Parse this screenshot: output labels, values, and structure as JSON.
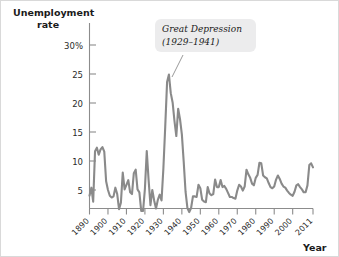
{
  "chart_data": {
    "type": "line",
    "title": "Unemployment rate",
    "ylabel": "Unemployment rate",
    "xlabel": "Year",
    "ylim": [
      0,
      32
    ],
    "xlim": [
      1890,
      2011
    ],
    "grid": false,
    "legend": false,
    "y_unit": "%",
    "y_ticks": [
      "30%",
      "25",
      "20",
      "15",
      "10",
      "5"
    ],
    "y_tick_values": [
      30,
      25,
      20,
      15,
      10,
      5
    ],
    "x_ticks": [
      "1890",
      "1900",
      "1910",
      "1920",
      "1930",
      "1940",
      "1950",
      "1960",
      "1970",
      "1980",
      "1990",
      "2000",
      "2011"
    ],
    "x_tick_values": [
      1890,
      1900,
      1910,
      1920,
      1930,
      1940,
      1950,
      1960,
      1970,
      1980,
      1990,
      2000,
      2011
    ],
    "line_color": "#8a8a8a",
    "annotations": [
      {
        "text_line1": "Great Depression",
        "text_line2": "(1929–1941)",
        "points_to_year": 1933,
        "points_to_value": 24.9
      }
    ],
    "series": [
      {
        "name": "Unemployment rate",
        "x": [
          1890,
          1891,
          1892,
          1893,
          1894,
          1895,
          1896,
          1897,
          1898,
          1899,
          1900,
          1901,
          1902,
          1903,
          1904,
          1905,
          1906,
          1907,
          1908,
          1909,
          1910,
          1911,
          1912,
          1913,
          1914,
          1915,
          1916,
          1917,
          1918,
          1919,
          1920,
          1921,
          1922,
          1923,
          1924,
          1925,
          1926,
          1927,
          1928,
          1929,
          1930,
          1931,
          1932,
          1933,
          1934,
          1935,
          1936,
          1937,
          1938,
          1939,
          1940,
          1941,
          1942,
          1943,
          1944,
          1945,
          1946,
          1947,
          1948,
          1949,
          1950,
          1951,
          1952,
          1953,
          1954,
          1955,
          1956,
          1957,
          1958,
          1959,
          1960,
          1961,
          1962,
          1963,
          1964,
          1965,
          1966,
          1967,
          1968,
          1969,
          1970,
          1971,
          1972,
          1973,
          1974,
          1975,
          1976,
          1977,
          1978,
          1979,
          1980,
          1981,
          1982,
          1983,
          1984,
          1985,
          1986,
          1987,
          1988,
          1989,
          1990,
          1991,
          1992,
          1993,
          1994,
          1995,
          1996,
          1997,
          1998,
          1999,
          2000,
          2001,
          2002,
          2003,
          2004,
          2005,
          2006,
          2007,
          2008,
          2009,
          2010,
          2011
        ],
        "values": [
          4.0,
          5.4,
          3.0,
          11.7,
          12.3,
          11.1,
          12.0,
          12.4,
          11.6,
          6.5,
          5.0,
          4.0,
          3.7,
          3.9,
          5.4,
          4.3,
          1.7,
          2.8,
          8.0,
          5.1,
          5.9,
          6.7,
          4.6,
          4.3,
          7.9,
          8.5,
          5.1,
          4.6,
          1.4,
          1.4,
          5.2,
          11.7,
          6.7,
          2.4,
          5.0,
          3.2,
          1.8,
          3.3,
          4.2,
          3.2,
          8.7,
          15.9,
          23.6,
          24.9,
          21.7,
          20.1,
          16.9,
          14.3,
          19.0,
          17.2,
          14.6,
          9.9,
          4.7,
          1.9,
          1.2,
          1.9,
          3.9,
          3.9,
          3.8,
          5.9,
          5.3,
          3.3,
          3.0,
          2.9,
          5.5,
          4.4,
          4.1,
          4.3,
          6.8,
          5.5,
          5.5,
          6.7,
          5.5,
          5.7,
          5.2,
          4.5,
          3.8,
          3.8,
          3.6,
          3.5,
          4.9,
          5.9,
          5.6,
          4.9,
          5.6,
          8.5,
          7.7,
          7.1,
          6.1,
          5.8,
          7.1,
          7.6,
          9.7,
          9.6,
          7.5,
          7.2,
          7.0,
          6.2,
          5.5,
          5.3,
          5.6,
          6.8,
          7.5,
          6.9,
          6.1,
          5.6,
          5.4,
          4.9,
          4.5,
          4.2,
          4.0,
          4.7,
          5.8,
          6.0,
          5.5,
          5.1,
          4.6,
          4.6,
          5.8,
          9.3,
          9.6,
          8.9
        ]
      }
    ]
  },
  "labels": {
    "y_axis_title_line1": "Unemployment",
    "y_axis_title_line2": "rate",
    "x_axis_title": "Year"
  }
}
